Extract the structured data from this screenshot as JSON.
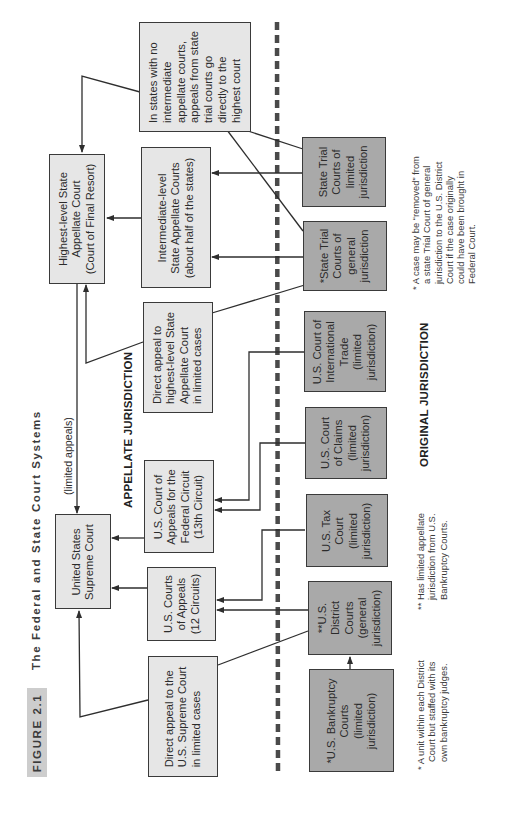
{
  "figure": {
    "number": "FIGURE 2.1",
    "title": "The  Federal  and  State  Court  Systems"
  },
  "sections": {
    "appellate": "APPELLATE JURISDICTION",
    "original": "ORIGINAL JURISDICTION"
  },
  "edge_labels": {
    "limited_appeals": "(limited appeals)"
  },
  "boxes": {
    "supreme_court": [
      "United States",
      "Supreme Court"
    ],
    "highest_state": [
      "Highest-level State",
      "Appellate Court",
      "(Court of Final Resort)"
    ],
    "intermediate_state": [
      "Intermediate-level",
      "State Appellate Courts",
      "(about half of the states)"
    ],
    "no_intermediate_note": [
      "In states with no",
      "intermediate",
      "appellate courts,",
      "appeals from state",
      "trial courts go",
      "directly to the",
      "highest court"
    ],
    "direct_appeal_state": [
      "Direct appeal to",
      "highest-level State",
      "Appellate Court",
      "in limited cases"
    ],
    "federal_circuit": [
      "U.S. Court of",
      "Appeals for the",
      "Federal Circuit",
      "(13th Circuit)"
    ],
    "courts_of_appeals": [
      "U.S. Courts",
      "of Appeals",
      "(12 Circuits)"
    ],
    "direct_appeal_us": [
      "Direct appeal to the",
      "U.S. Supreme Court",
      "in limited cases"
    ],
    "state_trial_limited": [
      "State Trial",
      "Courts of",
      "limited",
      "jurisdiction"
    ],
    "state_trial_general": [
      "*State Trial",
      "Courts of",
      "general",
      "jurisdiction"
    ],
    "international_trade": [
      "U.S. Court of",
      "International",
      "Trade",
      "(limited",
      "jurisdiction)"
    ],
    "court_of_claims": [
      "U.S. Court",
      "of Claims",
      "(limited",
      "jurisdiction)"
    ],
    "tax_court": [
      "U.S. Tax",
      "Court",
      "(limited",
      "jurisdiction)"
    ],
    "district_courts": [
      "**U.S.",
      "District",
      "Courts",
      "(general",
      "jurisdiction)"
    ],
    "bankruptcy_courts": [
      "*U.S. Bankruptcy",
      "Courts",
      "(limited",
      "jurisdiction)"
    ]
  },
  "footnotes": {
    "removal": [
      "* A case may be “removed” from",
      "a state Trial Court of general",
      "jurisdiction to the U.S. District",
      "Court if the case originally",
      "could have been brought in",
      "Federal Court."
    ],
    "district": [
      "** Has limited appellate",
      "jurisdiction from U.S.",
      "Bankruptcy Courts."
    ],
    "bankruptcy": [
      "* A unit within each District",
      "Court but staffed with its",
      "own bankruptcy judges."
    ]
  },
  "colors": {
    "light_box": "#e6e6e6",
    "dark_box": "#a9a9a9",
    "line": "#2e2e2e",
    "dashed_divider": "#4a4a4a",
    "figure_badge": "#cdcdcd"
  }
}
